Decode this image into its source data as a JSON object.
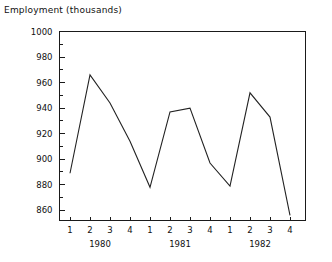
{
  "chart_data": {
    "type": "line",
    "title": "Employment (thousands)",
    "xlabel": "",
    "ylabel": "",
    "ylim": [
      852,
      1000
    ],
    "xlim": [
      0.5,
      12.8
    ],
    "grid": false,
    "legend": null,
    "y_ticks": [
      1000,
      980,
      960,
      940,
      920,
      900,
      880,
      860
    ],
    "y_tick_labels": [
      "1000",
      "980",
      "960",
      "940",
      "920",
      "900",
      "880",
      "860"
    ],
    "minor_y_ticks": [
      990,
      970,
      950,
      930,
      910,
      890,
      870
    ],
    "categories": [
      "1980 Q1",
      "1980 Q2",
      "1980 Q3",
      "1980 Q4",
      "1981 Q1",
      "1981 Q2",
      "1981 Q3",
      "1981 Q4",
      "1982 Q1",
      "1982 Q2",
      "1982 Q3",
      "1982 Q4"
    ],
    "x_tick_labels": [
      "1",
      "2",
      "3",
      "4",
      "1",
      "2",
      "3",
      "4",
      "1",
      "2",
      "3",
      "4"
    ],
    "group_labels": [
      "1980",
      "1981",
      "1982"
    ],
    "values": [
      889,
      966,
      944,
      914,
      878,
      937,
      940,
      897,
      879,
      952,
      933,
      856
    ],
    "series": [
      {
        "name": "Employment",
        "values": [
          889,
          966,
          944,
          914,
          878,
          937,
          940,
          897,
          879,
          952,
          933,
          856
        ]
      }
    ],
    "line_color": "#222222",
    "axis_color": "#1a1a1a",
    "background_color": "#ffffff"
  }
}
